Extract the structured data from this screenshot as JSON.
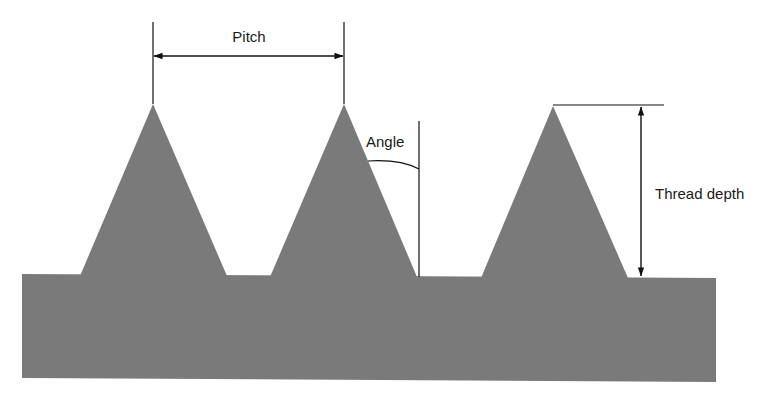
{
  "diagram": {
    "labels": {
      "pitch": "Pitch",
      "angle": "Angle",
      "thread_depth": "Thread depth"
    },
    "colors": {
      "fill": "#7a7a7a",
      "line": "#111111",
      "background": "#ffffff"
    },
    "threads": [
      {
        "apex": [
          153,
          104
        ],
        "base_left": [
          80,
          275
        ],
        "base_right": [
          227,
          275
        ]
      },
      {
        "apex": [
          344,
          104
        ],
        "base_left": [
          270,
          276
        ],
        "base_right": [
          416,
          276
        ]
      },
      {
        "apex": [
          553,
          106
        ],
        "base_left": [
          481,
          277
        ],
        "base_right": [
          628,
          277
        ]
      }
    ],
    "base_body": {
      "x1": 22,
      "x2": 716,
      "top_left": 274,
      "top_right": 278,
      "bottom_left": 378,
      "bottom_right": 382
    }
  }
}
